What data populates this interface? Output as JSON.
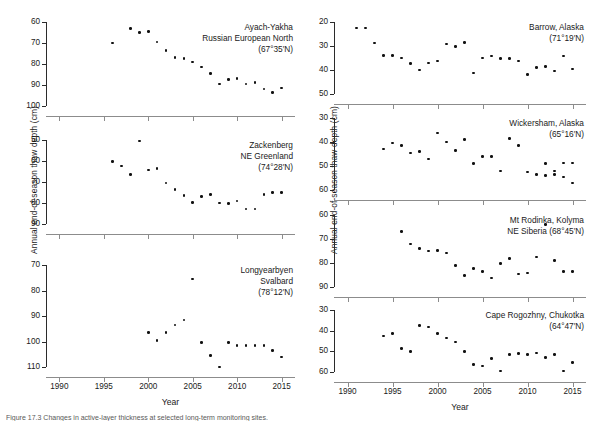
{
  "figure": {
    "ylabel": "Annual end-of-season thaw depth (cm)",
    "xlabel": "Year",
    "caption": "Figure 17.3  Changes in active-layer thickness at selected long-term monitoring sites.",
    "point_color": "#111111",
    "axis_color": "#2b2b2b"
  },
  "chart_data": {
    "type": "scatter",
    "xlabel": "Year",
    "ylabel": "Annual end-of-season thaw depth (cm)",
    "xlim": [
      1988.5,
      2016.5
    ],
    "xticks": [
      1990,
      1995,
      2000,
      2005,
      2010,
      2015
    ],
    "grid": false,
    "legend": "none",
    "note": "Y axes are inverted (depth increases downward).",
    "panels": [
      {
        "id": "ayach-yakha",
        "column": "left",
        "row": 1,
        "title_lines": [
          "Ayach-Yakha",
          "Russian European North",
          "(67°35′N)"
        ],
        "site": "Ayach-Yakha",
        "region": "Russian European North",
        "latitude": "67°35′N",
        "ylim": [
          60,
          100
        ],
        "yticks": [
          60,
          70,
          80,
          90,
          100
        ],
        "y_inverted": true,
        "x": [
          1996,
          1998,
          1999,
          2000,
          2001,
          2002,
          2003,
          2004,
          2005,
          2006,
          2007,
          2008,
          2009,
          2010,
          2011,
          2012,
          2013,
          2014,
          2015
        ],
        "y": [
          70.0,
          63.2,
          65.0,
          64.5,
          69.5,
          73.5,
          76.8,
          77.5,
          79.0,
          81.5,
          84.5,
          89.5,
          87.5,
          87.0,
          89.5,
          88.8,
          92.0,
          93.5,
          91.5,
          91.0
        ]
      },
      {
        "id": "zackenberg",
        "column": "left",
        "row": 2,
        "title_lines": [
          "Zackenberg",
          "NE Greenland",
          "(74°28′N)"
        ],
        "site": "Zackenberg",
        "region": "NE Greenland",
        "latitude": "74°28′N",
        "ylim": [
          50,
          90
        ],
        "yticks": [
          50,
          60,
          70,
          80,
          90
        ],
        "y_inverted": true,
        "x": [
          1996,
          1997,
          1998,
          1999,
          2000,
          2001,
          2002,
          2003,
          2004,
          2005,
          2006,
          2007,
          2008,
          2009,
          2010,
          2011,
          2012,
          2013,
          2014,
          2015
        ],
        "y": [
          60.3,
          62.3,
          66.5,
          50.5,
          64.2,
          63.6,
          70.5,
          73.5,
          76.5,
          79.8,
          76.8,
          76.0,
          80.0,
          80.2,
          79.0,
          82.8,
          82.8,
          76.0,
          75.0,
          75.0
        ]
      },
      {
        "id": "longyearbyen",
        "column": "left",
        "row": 3,
        "title_lines": [
          "Longyearbyen",
          "Svalbard",
          "(78°12′N)"
        ],
        "site": "Longyearbyen",
        "region": "Svalbard",
        "latitude": "78°12′N",
        "ylim": [
          70,
          110
        ],
        "yticks": [
          70,
          80,
          90,
          100,
          110
        ],
        "y_inverted": true,
        "x": [
          2000,
          2001,
          2002,
          2003,
          2004,
          2005,
          2006,
          2007,
          2008,
          2009,
          2010,
          2011,
          2012,
          2013,
          2014,
          2015
        ],
        "y": [
          96.5,
          99.5,
          96.5,
          93.5,
          91.5,
          75.5,
          100.5,
          105.5,
          110.0,
          100.5,
          101.5,
          101.5,
          101.5,
          101.5,
          103.5,
          106.0
        ]
      },
      {
        "id": "barrow",
        "column": "right",
        "row": 1,
        "title_lines": [
          "Barrow, Alaska",
          "(71°19′N)"
        ],
        "site": "Barrow",
        "region": "Alaska",
        "latitude": "71°19′N",
        "ylim": [
          20,
          50
        ],
        "yticks": [
          20,
          30,
          40,
          50
        ],
        "y_inverted": true,
        "x": [
          1991,
          1992,
          1993,
          1994,
          1995,
          1996,
          1997,
          1998,
          1999,
          2000,
          2001,
          2002,
          2003,
          2004,
          2005,
          2006,
          2007,
          2008,
          2009,
          2010,
          2011,
          2012,
          2013,
          2014,
          2015
        ],
        "y": [
          22.5,
          22.5,
          28.8,
          34.0,
          34.0,
          35.0,
          37.3,
          40.0,
          37.0,
          36.2,
          29.2,
          30.2,
          28.5,
          41.2,
          35.0,
          34.2,
          35.2,
          35.2,
          36.2,
          41.8,
          39.0,
          38.5,
          40.5,
          34.2,
          39.5
        ]
      },
      {
        "id": "wickersham",
        "column": "right",
        "row": 2,
        "title_lines": [
          "Wickersham, Alaska",
          "(65°16′N)"
        ],
        "site": "Wickersham",
        "region": "Alaska",
        "latitude": "65°16′N",
        "ylim": [
          30,
          60
        ],
        "yticks": [
          30,
          40,
          50,
          60
        ],
        "y_inverted": true,
        "x": [
          1994,
          1995,
          1996,
          1997,
          1998,
          1999,
          2000,
          2001,
          2002,
          2003,
          2004,
          2005,
          2006,
          2007,
          2008,
          2009,
          2010,
          2011,
          2012,
          2013,
          2014,
          2015
        ],
        "y": [
          43.0,
          40.5,
          41.5,
          44.5,
          44.0,
          47.0,
          36.2,
          40.0,
          43.5,
          39.0,
          49.0,
          46.0,
          46.0,
          52.0,
          38.5,
          41.5,
          52.5,
          53.5,
          54.0,
          53.5,
          48.8,
          48.8
        ],
        "y_extra": [
          49.0,
          52.0,
          54.5,
          57.0
        ]
      },
      {
        "id": "mt-rodinka",
        "column": "right",
        "row": 3,
        "title_lines": [
          "Mt Rodinka, Kolyma",
          "NE Siberia (68°45′N)"
        ],
        "site": "Mt Rodinka, Kolyma",
        "region": "NE Siberia",
        "latitude": "68°45′N",
        "ylim": [
          60,
          90
        ],
        "yticks": [
          60,
          70,
          80,
          90
        ],
        "y_inverted": true,
        "x": [
          1996,
          1997,
          1998,
          1999,
          2000,
          2001,
          2002,
          2003,
          2004,
          2005,
          2006,
          2007,
          2008,
          2009,
          2010,
          2011,
          2012,
          2013,
          2014,
          2015
        ],
        "y": [
          66.8,
          72.0,
          74.0,
          75.0,
          74.8,
          75.8,
          81.0,
          85.2,
          82.2,
          83.5,
          86.2,
          80.2,
          78.2,
          84.5,
          84.2,
          77.5,
          64.0,
          79.0,
          83.5,
          83.5
        ]
      },
      {
        "id": "cape-rogozhny",
        "column": "right",
        "row": 4,
        "title_lines": [
          "Cape Rogozhny, Chukotka",
          "(64°47′N)"
        ],
        "site": "Cape Rogozhny",
        "region": "Chukotka",
        "latitude": "64°47′N",
        "ylim": [
          30,
          60
        ],
        "yticks": [
          30,
          40,
          50,
          60
        ],
        "y_inverted": true,
        "x": [
          1994,
          1995,
          1996,
          1997,
          1998,
          1999,
          2000,
          2001,
          2002,
          2003,
          2004,
          2005,
          2006,
          2007,
          2008,
          2009,
          2010,
          2011,
          2012,
          2013,
          2014,
          2015
        ],
        "y": [
          42.5,
          41.5,
          48.5,
          50.0,
          37.5,
          38.2,
          41.5,
          43.5,
          45.5,
          50.0,
          56.5,
          57.0,
          53.5,
          59.5,
          51.5,
          51.0,
          51.5,
          50.8,
          53.0,
          51.5,
          59.5,
          55.5
        ]
      }
    ]
  }
}
